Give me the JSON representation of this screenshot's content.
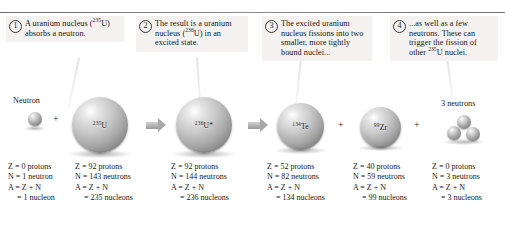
{
  "figure": {
    "steps": [
      {
        "number": "1",
        "text_html": "A uranium nucleus (<sup>235</sup>U) absorbs a neutron."
      },
      {
        "number": "2",
        "text_html": "The result is a uranium nucleus (<sup>236</sup>U) in an excited state."
      },
      {
        "number": "3",
        "text_html": "The excited uranium nucleus fissions into two smaller, more tightly bound nuclei..."
      },
      {
        "number": "4",
        "text_html": "...as well as a few neutrons. These can trigger the fission of other <sup>235</sup>U nuclei."
      }
    ],
    "objects": [
      {
        "name": "neutron",
        "label": "Neutron",
        "sphere_label_html": ""
      },
      {
        "name": "uranium-235",
        "label": "",
        "sphere_label_html": "<sup>235</sup>U"
      },
      {
        "name": "uranium-236-excited",
        "label": "",
        "sphere_label_html": "<sup>236</sup>U*"
      },
      {
        "name": "tellurium-134",
        "label": "",
        "sphere_label_html": "<sup>134</sup>Te"
      },
      {
        "name": "zirconium-99",
        "label": "",
        "sphere_label_html": "<sup>99</sup>Zr"
      },
      {
        "name": "three-neutrons",
        "label": "3 neutrons",
        "sphere_label_html": ""
      }
    ],
    "operators": {
      "plus": "+"
    },
    "columns": [
      {
        "for": "neutron",
        "z": "Z = 0 protons",
        "n": "N = 1 neutron",
        "a": "A = Z + N",
        "total": "= 1 nucleon"
      },
      {
        "for": "uranium-235",
        "z": "Z = 92 protons",
        "n": "N = 143 neutrons",
        "a": "A = Z + N",
        "total": "= 235 nucleons"
      },
      {
        "for": "uranium-236-excited",
        "z": "Z = 92 protons",
        "n": "N = 144 neutrons",
        "a": "A = Z + N",
        "total": "= 236 nucleons"
      },
      {
        "for": "tellurium-134",
        "z": "Z = 52 protons",
        "n": "N = 82 neutrons",
        "a": "A = Z + N",
        "total": "= 134 nucleons"
      },
      {
        "for": "zirconium-99",
        "z": "Z = 40 protons",
        "n": "N = 59 neutrons",
        "a": "A = Z + N",
        "total": "= 99 nucleons"
      },
      {
        "for": "three-neutrons",
        "z": "Z = 0 protons",
        "n": "N = 3 neutrons",
        "a": "A = Z + N",
        "total": "= 3 nucleons"
      }
    ],
    "colors": {
      "background": "#ffffff",
      "caption_background": "#f3f2f0",
      "text": "#17171a",
      "rule": "#7a7a7a",
      "arrow": "#a8a8a8",
      "sphere_highlight": "#ffffff",
      "sphere_shade": "#606060"
    }
  }
}
